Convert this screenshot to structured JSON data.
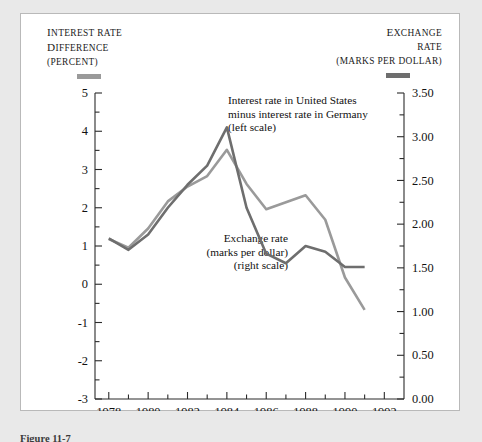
{
  "figure": {
    "caption": "Figure 11-7"
  },
  "axes": {
    "left_title_lines": [
      "INTEREST RATE",
      "DIFFERENCE",
      "(PERCENT)"
    ],
    "right_title_lines": [
      "EXCHANGE",
      "RATE",
      "(MARKS PER DOLLAR)"
    ],
    "left_ticks": [
      "5",
      "4",
      "3",
      "2",
      "1",
      "0",
      "-1",
      "-2",
      "-3"
    ],
    "right_ticks": [
      "3.50",
      "3.00",
      "2.50",
      "2.00",
      "1.50",
      "1.00",
      "0.50",
      "0.00"
    ],
    "x_ticks": [
      "1978",
      "1980",
      "1982",
      "1984",
      "1986",
      "1988",
      "1990",
      "1992"
    ]
  },
  "annotations": {
    "interest": [
      "Interest rate in United States",
      "minus interest rate in Germany",
      "(left scale)"
    ],
    "exchange": [
      "Exchange rate",
      "(marks per dollar)",
      "(right scale)"
    ]
  },
  "colors": {
    "exchange_line": "#9a9a9a",
    "interest_line": "#6e6e6e",
    "axis": "#2b2b2b",
    "panel": "#ffffff",
    "page": "#e9e9e9"
  },
  "chart_data": {
    "type": "line",
    "title": "",
    "xlabel": "",
    "ylabel": "Interest rate difference (percent)",
    "y2label": "Exchange rate (marks per dollar)",
    "xlim": [
      1977.3,
      1993.0
    ],
    "ylim": [
      -3,
      5
    ],
    "y2lim": [
      0.0,
      3.5
    ],
    "grid": false,
    "legend": "annotations-inline",
    "x": [
      1978,
      1979,
      1980,
      1981,
      1982,
      1983,
      1984,
      1985,
      1986,
      1987,
      1988,
      1989,
      1990,
      1991
    ],
    "series": [
      {
        "name": "Exchange rate (marks per dollar)",
        "axis": "right",
        "color": "#9a9a9a",
        "values": [
          1.83,
          1.73,
          1.95,
          2.26,
          2.43,
          2.55,
          2.85,
          2.46,
          2.17,
          2.25,
          2.33,
          2.05,
          1.39,
          1.02
        ]
      },
      {
        "name": "Interest rate in United States minus interest rate in Germany",
        "axis": "left",
        "color": "#6e6e6e",
        "values": [
          1.2,
          0.9,
          1.3,
          2.0,
          2.6,
          3.1,
          4.1,
          2.0,
          0.8,
          0.55,
          1.0,
          0.85,
          0.45,
          0.45
        ]
      }
    ]
  }
}
